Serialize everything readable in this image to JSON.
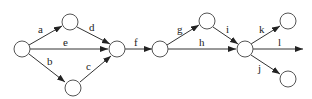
{
  "diagram": {
    "type": "network-graph",
    "colors": {
      "stroke": "#333333",
      "node_fill": "#ffffff",
      "label": "#222222"
    },
    "nodes": [
      {
        "id": "n1",
        "x": 22,
        "y": 49
      },
      {
        "id": "n2",
        "x": 70,
        "y": 22
      },
      {
        "id": "n3",
        "x": 73,
        "y": 88
      },
      {
        "id": "n4",
        "x": 117,
        "y": 49
      },
      {
        "id": "n5",
        "x": 160,
        "y": 49
      },
      {
        "id": "n6",
        "x": 207,
        "y": 21
      },
      {
        "id": "n7",
        "x": 245,
        "y": 49
      },
      {
        "id": "n8",
        "x": 288,
        "y": 21
      },
      {
        "id": "n9",
        "x": 288,
        "y": 79
      }
    ],
    "edges": [
      {
        "label": "a",
        "from": "n1",
        "to": "n2"
      },
      {
        "label": "e",
        "from": "n1",
        "to": "n4"
      },
      {
        "label": "b",
        "from": "n1",
        "to": "n3"
      },
      {
        "label": "d",
        "from": "n2",
        "to": "n4"
      },
      {
        "label": "c",
        "from": "n3",
        "to": "n4"
      },
      {
        "label": "f",
        "from": "n4",
        "to": "n5"
      },
      {
        "label": "g",
        "from": "n5",
        "to": "n6"
      },
      {
        "label": "h",
        "from": "n5",
        "to": "n7"
      },
      {
        "label": "i",
        "from": "n6",
        "to": "n7"
      },
      {
        "label": "k",
        "from": "n7",
        "to": "n8"
      },
      {
        "label": "l",
        "from": "n7",
        "to": "open-end"
      },
      {
        "label": "j",
        "from": "n7",
        "to": "n9"
      }
    ]
  }
}
